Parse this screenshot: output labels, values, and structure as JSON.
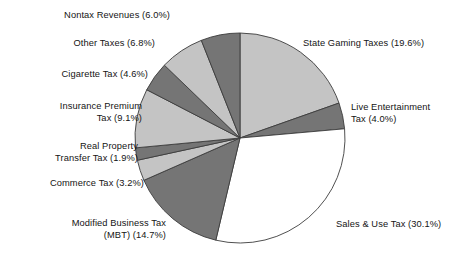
{
  "chart_data": {
    "type": "pie",
    "title": "",
    "subtitle": "",
    "xlabel": "",
    "ylabel": "",
    "legend_position": "callout-labels",
    "grid": false,
    "units": "percent",
    "total": 100.0,
    "start_angle_deg": 0,
    "direction": "clockwise",
    "categories": [
      "State Gaming Taxes",
      "Live Entertainment Tax",
      "Sales & Use Tax",
      "Modified Business Tax (MBT)",
      "Commerce Tax",
      "Real Property Transfer Tax",
      "Insurance Premium Tax",
      "Cigarette Tax",
      "Other Taxes",
      "Nontax Revenues"
    ],
    "values": [
      19.6,
      4.0,
      30.1,
      14.7,
      3.2,
      1.9,
      9.1,
      4.6,
      6.8,
      6.0
    ],
    "colors": [
      "#c4c4c4",
      "#757575",
      "#ffffff",
      "#757575",
      "#c4c4c4",
      "#757575",
      "#c4c4c4",
      "#757575",
      "#c4c4c4",
      "#757575"
    ],
    "slices": [
      {
        "label": "State Gaming Taxes",
        "value": 19.6,
        "display": "State Gaming Taxes (19.6%)",
        "color": "#c4c4c4"
      },
      {
        "label": "Live Entertainment Tax",
        "value": 4.0,
        "display": "Live Entertainment\nTax (4.0%)",
        "color": "#757575"
      },
      {
        "label": "Sales & Use Tax",
        "value": 30.1,
        "display": "Sales & Use Tax (30.1%)",
        "color": "#ffffff"
      },
      {
        "label": "Modified Business Tax (MBT)",
        "value": 14.7,
        "display": "Modified Business Tax\n(MBT) (14.7%)",
        "color": "#757575"
      },
      {
        "label": "Commerce Tax",
        "value": 3.2,
        "display": "Commerce Tax (3.2%)",
        "color": "#c4c4c4"
      },
      {
        "label": "Real Property Transfer Tax",
        "value": 1.9,
        "display": "Real Property\nTransfer Tax (1.9%)",
        "color": "#757575"
      },
      {
        "label": "Insurance Premium Tax",
        "value": 9.1,
        "display": "Insurance Premium\nTax (9.1%)",
        "color": "#c4c4c4"
      },
      {
        "label": "Cigarette Tax",
        "value": 4.6,
        "display": "Cigarette Tax (4.6%)",
        "color": "#757575"
      },
      {
        "label": "Other Taxes",
        "value": 6.8,
        "display": "Other Taxes (6.8%)",
        "color": "#c4c4c4"
      },
      {
        "label": "Nontax Revenues",
        "value": 6.0,
        "display": "Nontax Revenues (6.0%)",
        "color": "#757575"
      }
    ]
  },
  "labels": {
    "nontax_revenues": "Nontax Revenues (6.0%)",
    "other_taxes": "Other Taxes (6.8%)",
    "cigarette_tax": "Cigarette Tax (4.6%)",
    "insurance_premium_tax": "Insurance Premium\nTax (9.1%)",
    "real_property_transfer_tax": "Real Property\nTransfer Tax (1.9%)",
    "commerce_tax": "Commerce Tax (3.2%)",
    "modified_business_tax": "Modified Business Tax\n(MBT) (14.7%)",
    "state_gaming_taxes": "State Gaming Taxes (19.6%)",
    "live_entertainment_tax": "Live Entertainment\nTax (4.0%)",
    "sales_use_tax": "Sales & Use Tax (30.1%)"
  },
  "style": {
    "background": "#ffffff",
    "outline": "#3c3c3c",
    "light_fill": "#c4c4c4",
    "dark_fill": "#757575",
    "white_fill": "#ffffff"
  },
  "geometry": {
    "center_x": 240,
    "center_y": 138,
    "radius": 105
  }
}
